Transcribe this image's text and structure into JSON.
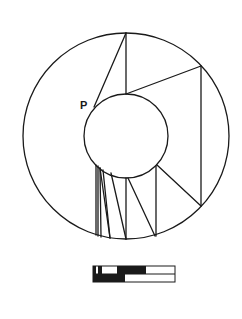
{
  "diagram": {
    "type": "geometric-figure",
    "stroke_color": "#1a1a1a",
    "background": "#ffffff",
    "outer_circle": {
      "cx": 126,
      "cy": 136,
      "r": 103
    },
    "inner_circle": {
      "cx": 126,
      "cy": 136,
      "r": 42
    },
    "labels": [
      {
        "id": "point-p",
        "text": "P",
        "x": 80,
        "y": 109
      }
    ],
    "segments": [
      {
        "x1": 126,
        "y1": 33,
        "x2": 94,
        "y2": 107
      },
      {
        "x1": 126,
        "y1": 33,
        "x2": 126,
        "y2": 94
      },
      {
        "x1": 126,
        "y1": 94,
        "x2": 201,
        "y2": 66
      },
      {
        "x1": 201,
        "y1": 66,
        "x2": 201,
        "y2": 206
      },
      {
        "x1": 157,
        "y1": 165,
        "x2": 201,
        "y2": 206
      },
      {
        "x1": 156,
        "y1": 166,
        "x2": 156,
        "y2": 236
      },
      {
        "x1": 96,
        "y1": 165,
        "x2": 96,
        "y2": 235
      },
      {
        "x1": 98,
        "y1": 166,
        "x2": 98,
        "y2": 236
      },
      {
        "x1": 100,
        "y1": 168,
        "x2": 101,
        "y2": 237
      },
      {
        "x1": 100,
        "y1": 168,
        "x2": 110,
        "y2": 238
      },
      {
        "x1": 103,
        "y1": 170,
        "x2": 110,
        "y2": 238
      },
      {
        "x1": 111,
        "y1": 173,
        "x2": 126,
        "y2": 239
      },
      {
        "x1": 126,
        "y1": 178,
        "x2": 126,
        "y2": 239
      },
      {
        "x1": 128,
        "y1": 178,
        "x2": 155,
        "y2": 236
      }
    ]
  },
  "scale_bar": {
    "x": 93,
    "y": 266,
    "width": 82,
    "row_height": 8,
    "rows": [
      {
        "segments": [
          {
            "fill": "#1a1a1a",
            "width": 3
          },
          {
            "fill": "#ffffff",
            "width": 2
          },
          {
            "fill": "#1a1a1a",
            "width": 4
          },
          {
            "fill": "#ffffff",
            "width": 15
          },
          {
            "fill": "#1a1a1a",
            "width": 29
          },
          {
            "fill": "#ffffff",
            "width": 29
          }
        ]
      },
      {
        "segments": [
          {
            "fill": "#1a1a1a",
            "width": 32
          },
          {
            "fill": "#ffffff",
            "width": 50
          }
        ]
      }
    ]
  }
}
